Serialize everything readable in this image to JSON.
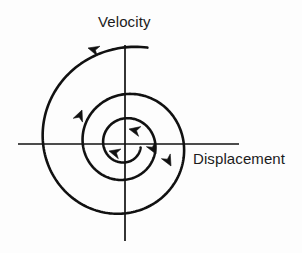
{
  "figure": {
    "title_text": "",
    "background_color": "#fdfdfd",
    "stroke_color": "#111111",
    "axis": {
      "vertical_label": "Velocity",
      "horizontal_label": "Displacement",
      "origin": {
        "x": 125,
        "y": 144
      },
      "horizontal_extent": {
        "x_min": 18,
        "x_max": 239
      },
      "vertical_extent": {
        "y_min": 45,
        "y_max": 241
      },
      "line_width": 1.7
    },
    "curve": {
      "name": "damped-oscillator-phase-spiral",
      "type": "inward-spiral",
      "direction": "counterclockwise",
      "line_width": 2.6,
      "start_point": {
        "x": 148,
        "y": 45
      },
      "end_point": {
        "x": 129,
        "y": 129
      },
      "turns": 2.75,
      "start_radius": 99,
      "end_radius": 16,
      "arrowheads": [
        {
          "id": "arrow-outer-top",
          "x": 88,
          "y": 48,
          "angle_deg": 196
        },
        {
          "id": "arrow-outer-bottom-right",
          "x": 171,
          "y": 166,
          "angle_deg": 62
        },
        {
          "id": "arrow-mid-left",
          "x": 82,
          "y": 110,
          "angle_deg": 292
        },
        {
          "id": "arrow-mid-bottom",
          "x": 109,
          "y": 151,
          "angle_deg": 195
        },
        {
          "id": "arrow-inner-right",
          "x": 156,
          "y": 154,
          "angle_deg": 62
        },
        {
          "id": "arrow-inner-center",
          "x": 129,
          "y": 129,
          "angle_deg": 193
        }
      ]
    }
  },
  "chart_data": {
    "type": "line",
    "title": "",
    "xlabel": "Displacement",
    "ylabel": "Velocity",
    "legend": [],
    "grid": false,
    "series": [
      {
        "name": "damped-oscillator-phase-spiral",
        "description": "Inward counterclockwise spiral trajectory in displacement-velocity phase space"
      }
    ]
  }
}
